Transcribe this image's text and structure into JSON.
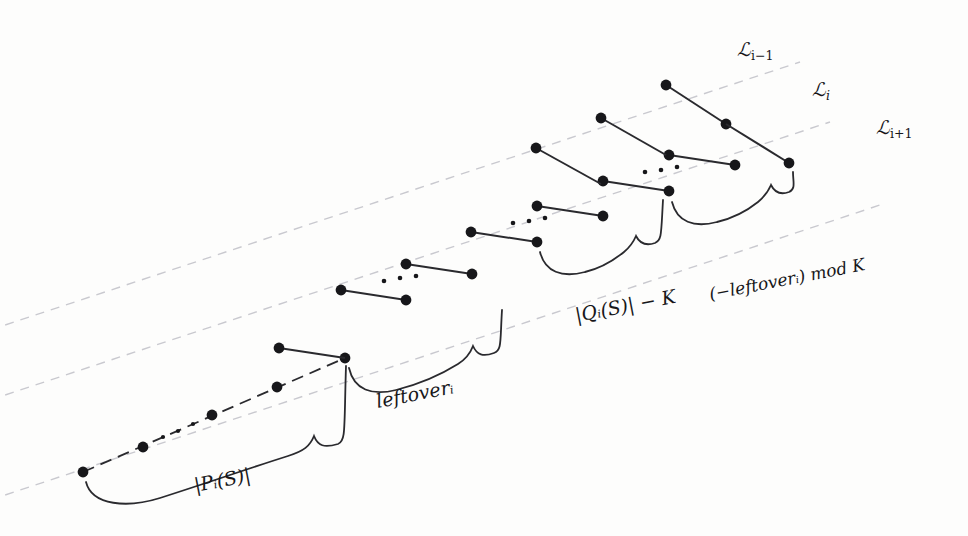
{
  "figure": {
    "kind": "mathematical-diagram",
    "background_color": "#fdfdfc",
    "ink_color": "#17171a",
    "guide_color": "#c9c9cf",
    "width": 968,
    "height": 536
  },
  "guide_lines": [
    {
      "name": "L_i_minus_1",
      "label": "ℒ",
      "sub": "i−1",
      "label_x": 737,
      "label_y": 50
    },
    {
      "name": "L_i",
      "label": "ℒ",
      "sub": "i",
      "label_x": 812,
      "label_y": 90
    },
    {
      "name": "L_i_plus_1",
      "label": "ℒ",
      "sub": "i+1",
      "label_x": 876,
      "label_y": 128
    }
  ],
  "brace_labels": [
    {
      "name": "P_i_S",
      "text_parts": [
        "|",
        "P",
        "i",
        "(S)|"
      ],
      "display": "|Pᵢ(S)|",
      "x": 196,
      "y": 494,
      "rotation": -11
    },
    {
      "name": "leftover_i",
      "text_parts": [
        "leftover",
        "i"
      ],
      "display": "leftoverᵢ",
      "x": 378,
      "y": 409,
      "rotation": -11
    },
    {
      "name": "Q_i_S_minus_K",
      "text_parts": [
        "|",
        "Q",
        "i",
        "(S)| − K"
      ],
      "display": "|Qᵢ(S)| − K",
      "x": 577,
      "y": 324,
      "rotation": -11
    },
    {
      "name": "neg_leftover_mod_K",
      "text_parts": [
        "(−leftover",
        "i",
        ") mod K"
      ],
      "display": "(−leftoverᵢ) mod K",
      "x": 711,
      "y": 303,
      "rotation": -11
    }
  ],
  "ellipses_label": "· · ·",
  "counts": {
    "dashed_guide_lines": 3,
    "left_dashed_run_dots": 5,
    "paired_segments": 8,
    "underbraces": 4
  }
}
